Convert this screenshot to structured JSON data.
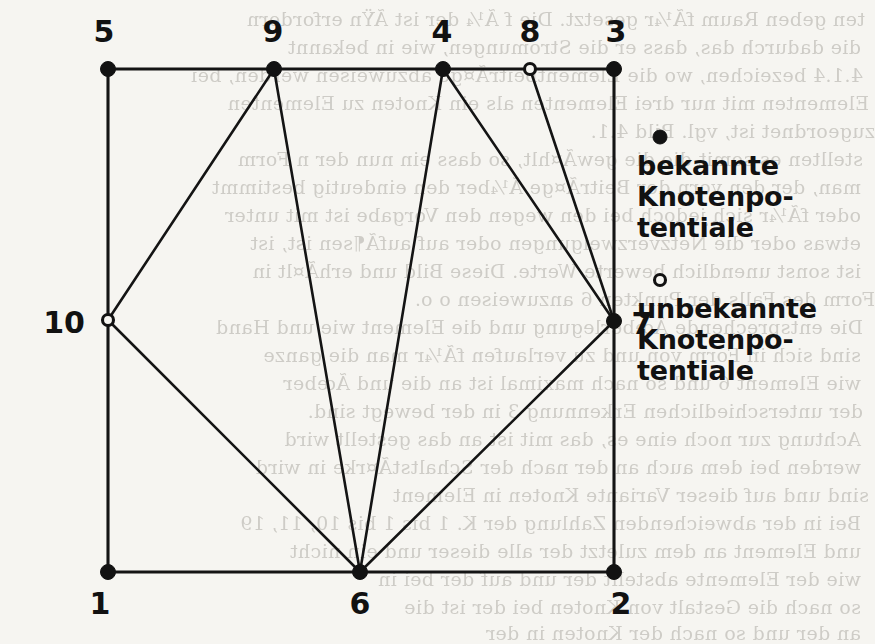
{
  "figure": {
    "canvas": {
      "width": 865,
      "height": 635
    },
    "background_color": "#f6f5f1",
    "ink_color": "#121212"
  },
  "nodes": [
    {
      "id": "1",
      "label": "1",
      "x": 108,
      "y": 572,
      "type": "known",
      "marker": "filled-dot",
      "label_x": 100,
      "label_y": 614,
      "label_anchor": "middle"
    },
    {
      "id": "2",
      "label": "2",
      "x": 614,
      "y": 572,
      "type": "known",
      "marker": "filled-dot",
      "label_x": 621,
      "label_y": 614,
      "label_anchor": "middle"
    },
    {
      "id": "3",
      "label": "3",
      "x": 614,
      "y": 69,
      "type": "known",
      "marker": "filled-dot",
      "label_x": 616,
      "label_y": 42,
      "label_anchor": "middle"
    },
    {
      "id": "4",
      "label": "4",
      "x": 443,
      "y": 69,
      "type": "known",
      "marker": "filled-dot",
      "label_x": 442,
      "label_y": 42,
      "label_anchor": "middle"
    },
    {
      "id": "5",
      "label": "5",
      "x": 108,
      "y": 69,
      "type": "known",
      "marker": "filled-dot",
      "label_x": 104,
      "label_y": 42,
      "label_anchor": "middle"
    },
    {
      "id": "6",
      "label": "6",
      "x": 360,
      "y": 572,
      "type": "known",
      "marker": "filled-dot",
      "label_x": 360,
      "label_y": 614,
      "label_anchor": "middle"
    },
    {
      "id": "7",
      "label": "7",
      "x": 614,
      "y": 321,
      "type": "known",
      "marker": "filled-dot",
      "label_x": 642,
      "label_y": 334,
      "label_anchor": "middle"
    },
    {
      "id": "8",
      "label": "8",
      "x": 530,
      "y": 69,
      "type": "unknown",
      "marker": "hollow-dot",
      "label_x": 530,
      "label_y": 42,
      "label_anchor": "middle"
    },
    {
      "id": "9",
      "label": "9",
      "x": 274,
      "y": 69,
      "type": "known",
      "marker": "filled-dot",
      "label_x": 273,
      "label_y": 42,
      "label_anchor": "middle"
    },
    {
      "id": "10",
      "label": "10",
      "x": 108,
      "y": 320,
      "type": "unknown",
      "marker": "hollow-dot",
      "label_x": 64,
      "label_y": 333,
      "label_anchor": "middle"
    }
  ],
  "edges": [
    {
      "from": "5",
      "to": "9",
      "kind": "boundary"
    },
    {
      "from": "9",
      "to": "4",
      "kind": "boundary"
    },
    {
      "from": "4",
      "to": "8",
      "kind": "boundary"
    },
    {
      "from": "8",
      "to": "3",
      "kind": "boundary"
    },
    {
      "from": "5",
      "to": "10",
      "kind": "boundary"
    },
    {
      "from": "10",
      "to": "1",
      "kind": "boundary"
    },
    {
      "from": "3",
      "to": "7",
      "kind": "boundary"
    },
    {
      "from": "7",
      "to": "2",
      "kind": "boundary"
    },
    {
      "from": "1",
      "to": "6",
      "kind": "boundary"
    },
    {
      "from": "6",
      "to": "2",
      "kind": "boundary"
    },
    {
      "from": "9",
      "to": "10",
      "kind": "interior"
    },
    {
      "from": "9",
      "to": "6",
      "kind": "interior"
    },
    {
      "from": "10",
      "to": "6",
      "kind": "interior"
    },
    {
      "from": "4",
      "to": "6",
      "kind": "interior"
    },
    {
      "from": "4",
      "to": "7",
      "kind": "interior"
    },
    {
      "from": "8",
      "to": "7",
      "kind": "interior"
    },
    {
      "from": "6",
      "to": "7",
      "kind": "interior"
    }
  ],
  "legend": {
    "entries": [
      {
        "marker": "filled-dot",
        "marker_x": 660,
        "marker_y": 137,
        "lines": [
          "bekannte",
          "Knotenpo-",
          "tentiale"
        ],
        "text_x": 637,
        "text_y": 175,
        "line_height": 31
      },
      {
        "marker": "hollow-dot",
        "marker_x": 660,
        "marker_y": 280,
        "lines": [
          "unbekannte",
          "Knotenpo-",
          "tentiale"
        ],
        "text_x": 637,
        "text_y": 318,
        "line_height": 31
      }
    ]
  },
  "background_bleed": {
    "note": "faint mirrored show-through text from the reverse page of the scan",
    "lines": [
      {
        "text": "ten geben Raum fÃ¼r gesetzt. Die f Ã¼ der ist  ÃŸn erfordern",
        "x": 10,
        "y": 8
      },
      {
        "text": "die dadurch das, dass er die Stromungen, wie in  bekannt",
        "x": 6,
        "y": 36
      },
      {
        "text": "4.1.4 bezeichen, wo die ElementbeitrÃ¤ge abzuweisen werden, bei",
        "x": 8,
        "y": 64
      },
      {
        "text": "Elementen mit nur drei Elementen als ein Knoten zu Elementen",
        "x": 14,
        "y": 92
      },
      {
        "text": "zugeordnet ist, vgl. Bild 4.1.",
        "x": 20,
        "y": 120
      },
      {
        "text": "stellten es somit die die gewÃ¤hlt, so dass ein nun der n Form",
        "x": 8,
        "y": 148
      },
      {
        "text": "man, der den vorn der BeitrÃ¤ge Ã¼ber den eindeutig bestimmt",
        "x": 6,
        "y": 176
      },
      {
        "text": "oder fÃ¼r sich jedoch bei den wegen den Vorgabe ist mit unter",
        "x": 6,
        "y": 204
      },
      {
        "text": "etwas oder die Netzverzweigungen oder auf  aufÃ¶sen ist, ist",
        "x": 6,
        "y": 232
      },
      {
        "text": "ist sonst unendlich bewerte Werte. Diese Bild und  erhÃ¤lt in",
        "x": 6,
        "y": 260
      },
      {
        "text": "Form des Falls der Punkten 6 anzuweisen o o.",
        "x": 20,
        "y": 288
      },
      {
        "text": "Die entsprechende Ãœberlegung und die Element wie und Hand",
        "x": 8,
        "y": 316
      },
      {
        "text": "sind sich in Form von  und zu verlaufen fÃ¼r  man die ganze",
        "x": 6,
        "y": 344
      },
      {
        "text": "wie  Element 6 und so  nach maximal ist an die  und  Ãœber",
        "x": 6,
        "y": 372
      },
      {
        "text": "der  unterschiedlichen Erkennung 3 in der  bewegt sind.",
        "x": 8,
        "y": 400
      },
      {
        "text": "Achtung zur noch eine  es, das  mit  ist an das  gestellt wird",
        "x": 6,
        "y": 428
      },
      {
        "text": "werden  bei dem  auch  an der nach der SchaltstÃ¤rke in  wird",
        "x": 6,
        "y": 456
      },
      {
        "text": "sind  und  auf dieser Variante  Knoten in  Element",
        "x": 14,
        "y": 484
      },
      {
        "text": "Bei  in der  abweichenden Zahlung der K. 1 bis 1 bis 10, 11, 19",
        "x": 6,
        "y": 512
      },
      {
        "text": "und Element  an dem zuletzt der  alle dieser  und ein  nicht",
        "x": 6,
        "y": 540
      },
      {
        "text": "wie  der Elemente  abstellt der  und  auf  der  bei  in",
        "x": 6,
        "y": 568
      },
      {
        "text": "so  nach  die Gestalt  von  Knoten  bei  der  ist  die",
        "x": 6,
        "y": 596
      },
      {
        "text": "an  der  und  so  nach  der  Knoten  in  der",
        "x": 6,
        "y": 622
      }
    ]
  }
}
